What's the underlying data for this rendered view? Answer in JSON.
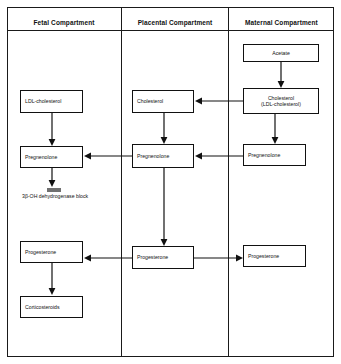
{
  "diagram": {
    "columns": [
      {
        "id": "fetal",
        "header": "Fetal Compartment"
      },
      {
        "id": "placental",
        "header": "Placental Compartment"
      },
      {
        "id": "maternal",
        "header": "Maternal Compartment"
      }
    ],
    "nodes": {
      "acetate": "Acetate",
      "maternal_cholesterol": "Cholesterol (LDL-cholesterol)",
      "maternal_cholesterol_line1": "Cholesterol",
      "maternal_cholesterol_line2": "(LDL-cholesterol)",
      "placental_cholesterol": "Cholesterol",
      "fetal_ldl_cholesterol": "LDL-cholesterol",
      "fetal_pregnenolone": "Pregnenolone",
      "placental_pregnenolone": "Pregnenolone",
      "maternal_pregnenolone": "Pregnenolone",
      "fetal_progesterone": "Progesterone",
      "placental_progesterone": "Progesterone",
      "maternal_progesterone": "Progesterone",
      "corticosteroids": "Corticosteroids"
    },
    "annotations": {
      "enzyme_block": "3β-OH dehydrogenase block"
    }
  }
}
